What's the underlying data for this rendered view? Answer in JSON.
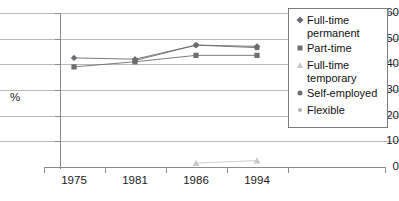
{
  "chart_data": {
    "type": "line",
    "title": "",
    "subtitle": "",
    "xlabel": "",
    "ylabel": "%",
    "categories": [
      "1975",
      "1981",
      "1986",
      "1994"
    ],
    "ylim": [
      0,
      60
    ],
    "ytick_labels": [
      "0",
      "10",
      "20",
      "30",
      "40",
      "50",
      "60"
    ],
    "ytick_values": [
      0,
      10,
      20,
      30,
      40,
      50,
      60
    ],
    "grid": true,
    "legend_position": "top-right inside",
    "series": [
      {
        "name": "Full-time\npermanent",
        "marker": "diamond",
        "color": "#6b6b78",
        "values": [
          42.5,
          42.0,
          47.5,
          47.0
        ]
      },
      {
        "name": "Part-time",
        "marker": "square",
        "color": "#6e6e6e",
        "values": [
          39.0,
          41.0,
          43.5,
          43.5
        ]
      },
      {
        "name": "Full-time\ntemporary",
        "marker": "triangle",
        "color": "#c8c8c8",
        "values": [
          null,
          null,
          1.5,
          2.5
        ]
      },
      {
        "name": "Self-employed",
        "marker": "circle",
        "color": "#6e6e6e",
        "values": [
          null,
          41.5,
          47.5,
          46.5
        ]
      },
      {
        "name": "Flexible",
        "marker": "small-circle",
        "color": "#b0b0b0",
        "values": [
          null,
          null,
          null,
          null
        ]
      }
    ]
  },
  "axis": {
    "y_label": "%",
    "y_ticks": [
      "60",
      "50",
      "40",
      "30",
      "20",
      "10",
      "0"
    ],
    "x_ticks": [
      "1975",
      "1981",
      "1986",
      "1994"
    ]
  },
  "legend": {
    "items": [
      {
        "label": "Full-time\npermanent",
        "marker": "diamond-marker-icon"
      },
      {
        "label": "Part-time",
        "marker": "square-marker-icon"
      },
      {
        "label": "Full-time\ntemporary",
        "marker": "triangle-marker-icon"
      },
      {
        "label": "Self-employed",
        "marker": "circle-marker-icon"
      },
      {
        "label": "Flexible",
        "marker": "small-circle-marker-icon"
      }
    ]
  },
  "colors": {
    "gridline": "#b9b9b9",
    "axis": "#8a8a8a",
    "text": "#1a1a1a",
    "legend_border": "#7d7d7d",
    "background": "#ffffff"
  }
}
